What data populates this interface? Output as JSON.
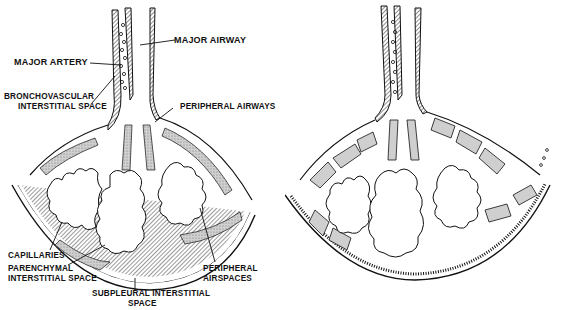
{
  "figure": {
    "panels": [
      {
        "id": "left",
        "description": "Lung lobule with interstitial spaces labeled",
        "labels": {
          "major_artery": "MAJOR ARTERY",
          "major_airway": "MAJOR AIRWAY",
          "bronchovascular_1": "BRONCHOVASCULAR",
          "bronchovascular_2": "INTERSTITIAL SPACE",
          "peripheral_airways": "PERIPHERAL AIRWAYS",
          "capillaries": "CAPILLARIES",
          "parenchymal_1": "PARENCHYMAL",
          "parenchymal_2": "INTERSTITIAL SPACE",
          "subpleural_1": "SUBPLEURAL INTERSTITIAL",
          "subpleural_2": "SPACE",
          "peripheral_airspaces_1": "PERIPHERAL",
          "peripheral_airspaces_2": "AIRSPACES"
        }
      },
      {
        "id": "right",
        "description": "Lung lobule with thickened interstitium (unlabeled)",
        "labels": {}
      }
    ],
    "colors": {
      "ink": "#111111",
      "stipple": "#b8b8b8",
      "background": "#ffffff"
    }
  }
}
